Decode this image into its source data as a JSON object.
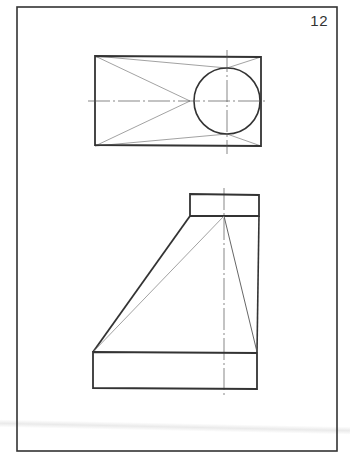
{
  "page": {
    "number": "12"
  },
  "colors": {
    "outline": "#333333",
    "construction": "#8a8a8a",
    "centerline": "#555555",
    "background": "#ffffff"
  },
  "drawing": {
    "frame": {
      "x": 17,
      "y": 7,
      "w": 320,
      "h": 444
    },
    "top_view": {
      "rect": {
        "x": 95,
        "y": 56,
        "w": 166,
        "h": 90
      },
      "circle": {
        "cx": 227,
        "cy": 101,
        "r": 33
      },
      "apex": {
        "x": 190,
        "y": 101
      }
    },
    "front_view": {
      "top_rect": {
        "x": 190,
        "y": 194,
        "w": 69,
        "h": 22
      },
      "base_rect": {
        "x": 93,
        "y": 352,
        "w": 164,
        "h": 36
      },
      "apex": {
        "x": 224,
        "y": 216
      },
      "centerline_x": 224
    }
  }
}
